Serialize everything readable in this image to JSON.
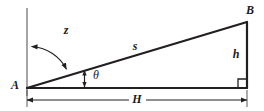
{
  "figure": {
    "background_color": "#ffffff",
    "stroke_color": "#231f20",
    "thin_stroke_color": "#58585b",
    "label_color": "#1a1a1a"
  },
  "labels": {
    "vertex_a": "A",
    "vertex_b": "B",
    "hypotenuse": "s",
    "zenith_angle": "z",
    "elevation_angle": "θ",
    "height": "h",
    "horizontal_distance": "H"
  },
  "geometry": {
    "point_a": {
      "x": 27,
      "y": 88
    },
    "point_b": {
      "x": 247,
      "y": 22
    },
    "point_c": {
      "x": 247,
      "y": 88
    },
    "vertical_ref_top": {
      "x": 27,
      "y": 8
    },
    "vertical_ref_bottom": {
      "x": 27,
      "y": 96
    },
    "dimension_line_y": 100,
    "right_angle_size": 9,
    "arc_radius": 42,
    "theta_marker_x": 84
  },
  "label_positions": {
    "vertex_a": {
      "x": 15,
      "y": 86
    },
    "vertex_b": {
      "x": 250,
      "y": 11
    },
    "hypotenuse": {
      "x": 135,
      "y": 47
    },
    "zenith_angle": {
      "x": 66,
      "y": 31
    },
    "elevation_angle": {
      "x": 96,
      "y": 76
    },
    "height": {
      "x": 236,
      "y": 55
    },
    "horizontal_distance": {
      "x": 137,
      "y": 100
    }
  }
}
